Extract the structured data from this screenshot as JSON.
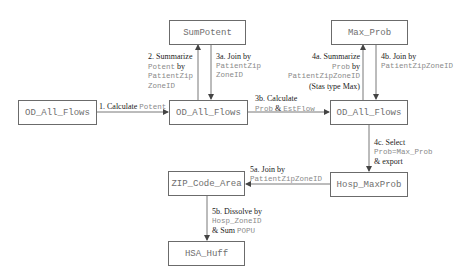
{
  "colors": {
    "box_border": "#6b6b6b",
    "box_text": "#6e6e6e",
    "arrow": "#555555",
    "label_text": "#222222",
    "code_text": "#8a8a8a"
  },
  "nodes": {
    "od_all_flows_1": "OD_All_Flows",
    "sum_potent": "SumPotent",
    "od_all_flows_2": "OD_All_Flows",
    "max_prob": "Max_Prob",
    "od_all_flows_3": "OD_All_Flows",
    "zip_code_area": "ZIP_Code_Area",
    "hosp_maxprob": "Hosp_MaxProb",
    "hsa_huff": "HSA_Huff"
  },
  "edges": {
    "step1": {
      "text": "1. Calculate",
      "code": "Potent"
    },
    "step2": {
      "line1": "2. Summarize",
      "code1": "Potent",
      "by": "by",
      "code2": "PatientZip",
      "code3": "ZoneID"
    },
    "step3a": {
      "line1": "3a. Join by",
      "code1": "PatientZip",
      "code2": "ZoneID"
    },
    "step3b": {
      "line1": "3b. Calculate",
      "code1": "Prob",
      "amp": "&",
      "code2": "EstFlow"
    },
    "step4a": {
      "line1": "4a. Summarize",
      "code1": "Prob",
      "by": "by",
      "code2": "PatientZipZoneID",
      "line4": "(Stas type Max)"
    },
    "step4b": {
      "line1": "4b. Join by",
      "code1": "PatientZipZoneID"
    },
    "step4c": {
      "line1": "4c. Select",
      "code1": "Prob=Max_Prob",
      "line3": "& export"
    },
    "step5a": {
      "line1": "5a. Join by",
      "code1": "PatientZipZoneID"
    },
    "step5b": {
      "line1": "5b. Dissolve by",
      "code1": "Hosp_ZoneID",
      "amp": "& Sum",
      "code2": "POPU"
    }
  }
}
